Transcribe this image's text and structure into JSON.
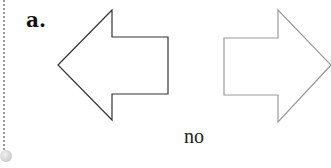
{
  "label": "a.",
  "caption": "no",
  "arrows": [
    {
      "direction": "left",
      "stroke": "#333333"
    },
    {
      "direction": "right",
      "stroke": "#9a9a9a"
    }
  ]
}
